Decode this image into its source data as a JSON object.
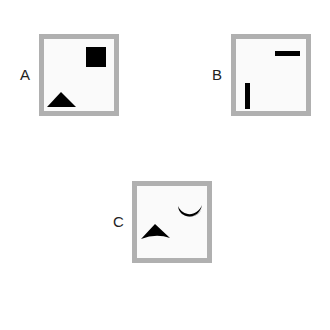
{
  "panels": [
    {
      "label": "A",
      "shapes": [
        "square",
        "triangle"
      ]
    },
    {
      "label": "B",
      "shapes": [
        "horizontal-bar",
        "vertical-bar"
      ]
    },
    {
      "label": "C",
      "shapes": [
        "crescent",
        "arrowhead-triangle"
      ]
    }
  ],
  "colors": {
    "border": "#b0b0b0",
    "shape": "#000000",
    "background": "#fafafa"
  }
}
